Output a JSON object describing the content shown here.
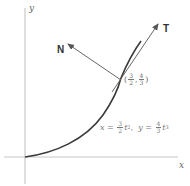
{
  "diagram": {
    "axes": {
      "x_label": "x",
      "y_label": "y"
    },
    "curve": {
      "equation": {
        "x_lhs": "x",
        "x_coef_num": "3",
        "x_coef_den": "2",
        "x_var": "t",
        "x_exp": "2",
        "sep": ",",
        "y_lhs": "y",
        "y_coef_num": "4",
        "y_coef_den": "3",
        "y_var": "t",
        "y_exp": "3"
      }
    },
    "point": {
      "open": "(",
      "x_num": "3",
      "x_den": "2",
      "comma": ",",
      "y_num": "4",
      "y_den": "3",
      "close": ")"
    },
    "vectors": {
      "tangent_label": "T",
      "normal_label": "N"
    },
    "colors": {
      "axis": "#c8c8c8",
      "curve": "#3a3a3a",
      "vector": "#666666",
      "background": "#ffffff"
    }
  }
}
